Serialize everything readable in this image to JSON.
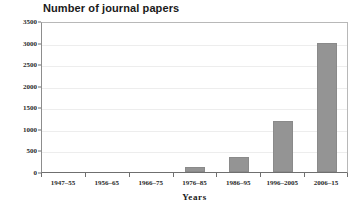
{
  "chart_data": {
    "type": "bar",
    "title": "Number of journal papers",
    "xlabel": "Years",
    "ylabel": "",
    "categories": [
      "1947–55",
      "1956–65",
      "1966–75",
      "1976–85",
      "1986–95",
      "1996–2005",
      "2006–15"
    ],
    "values": [
      0,
      0,
      0,
      120,
      350,
      1180,
      2990
    ],
    "ylim": [
      0,
      3500
    ],
    "yticks": [
      0,
      500,
      1000,
      1500,
      2000,
      2500,
      3000,
      3500
    ],
    "ytick_labels": [
      "0",
      "500",
      "1000",
      "1500",
      "2000",
      "2500",
      "3000",
      "3500"
    ],
    "grid": true,
    "legend": false,
    "bar_color": "#949494",
    "axis_color": "#6f6f6f",
    "gridline_color": "#ededed"
  }
}
